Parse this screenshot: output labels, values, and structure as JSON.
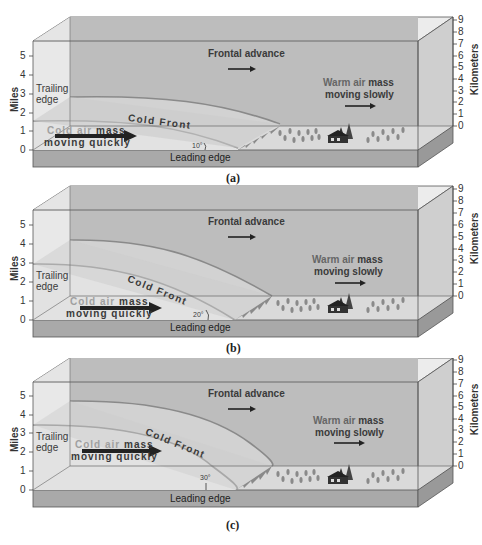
{
  "figure": {
    "panels": [
      {
        "id": "a",
        "caption": "(a)",
        "front_slope_angle": "10°",
        "labels": {
          "frontal_advance": "Frontal advance",
          "warm_air_line1_a": "Warm air",
          "warm_air_line1_b": "mass",
          "warm_air_line2": "moving slowly",
          "cold_air_line1_a": "Cold air",
          "cold_air_line1_b": "mass",
          "cold_air_line2": "moving quickly",
          "cold_front": "Cold Front",
          "trailing_edge_1": "Trailing",
          "trailing_edge_2": "edge",
          "leading_edge": "Leading edge"
        }
      },
      {
        "id": "b",
        "caption": "(b)",
        "front_slope_angle": "20°",
        "labels": {
          "frontal_advance": "Frontal advance",
          "warm_air_line1_a": "Warm air",
          "warm_air_line1_b": "mass",
          "warm_air_line2": "moving slowly",
          "cold_air_line1_a": "Cold air",
          "cold_air_line1_b": "mass",
          "cold_air_line2": "moving quickly",
          "cold_front": "Cold Front",
          "trailing_edge_1": "Trailing",
          "trailing_edge_2": "edge",
          "leading_edge": "Leading edge"
        }
      },
      {
        "id": "c",
        "caption": "(c)",
        "front_slope_angle": "30°",
        "labels": {
          "frontal_advance": "Frontal advance",
          "warm_air_line1_a": "Warm air",
          "warm_air_line1_b": "mass",
          "warm_air_line2": "moving slowly",
          "cold_air_line1_a": "Cold air",
          "cold_air_line1_b": "mass",
          "cold_air_line2": "moving quickly",
          "cold_front": "Cold Front",
          "trailing_edge_1": "Trailing",
          "trailing_edge_2": "edge",
          "leading_edge": "Leading edge"
        }
      }
    ],
    "left_axis": {
      "title": "Miles",
      "ticks": [
        "5",
        "4",
        "3",
        "2",
        "1",
        "0"
      ]
    },
    "right_axis": {
      "title": "Kilometers",
      "ticks": [
        "9",
        "8",
        "7",
        "6",
        "5",
        "4",
        "3",
        "2",
        "1",
        "0"
      ]
    },
    "colors": {
      "box_top": "#ececec",
      "box_back": "#b9b9b9",
      "box_side": "#cfcfcf",
      "ground": "#a9a9a9",
      "ground_top": "#dcdcdc",
      "cold_air": "#d6d6d6",
      "cold_air_light": "#e8e8e8",
      "front_line": "#8a8a8a",
      "text": "#3a3a3a",
      "cold_label_light": "#9a9a9a"
    }
  }
}
